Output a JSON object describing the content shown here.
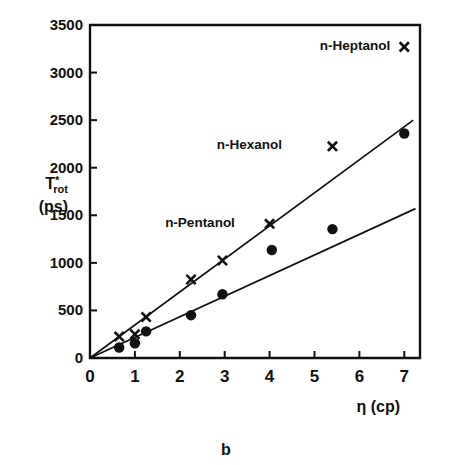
{
  "chart_data": {
    "type": "scatter",
    "title": "",
    "caption": "b",
    "xlabel": "η (cp)",
    "ylabel_main": "T",
    "ylabel_superscript": "*",
    "ylabel_subscript": "rot",
    "ylabel_units": "(ps)",
    "xlim": [
      0,
      7.35
    ],
    "ylim": [
      0,
      3500
    ],
    "grid": false,
    "legend_position": "inline-annotations",
    "xticks": [
      0,
      1,
      2,
      3,
      4,
      5,
      6,
      7
    ],
    "xtick_labels": [
      "0",
      "1",
      "2",
      "3",
      "4",
      "5",
      "6",
      "7"
    ],
    "yticks": [
      0,
      500,
      1000,
      1500,
      2000,
      2500,
      3000,
      3500
    ],
    "ytick_labels": [
      "0",
      "500",
      "1000",
      "1500",
      "2000",
      "2500",
      "3000",
      "3500"
    ],
    "annotations": [
      {
        "text": "n-Heptanol",
        "x": 5.9,
        "y": 3280
      },
      {
        "text": "n-Hexanol",
        "x": 3.55,
        "y": 2240
      },
      {
        "text": "n-Pentanol",
        "x": 2.45,
        "y": 1420
      }
    ],
    "series": [
      {
        "name": "upper-series-x-markers",
        "marker": "x",
        "x": [
          0.65,
          1.0,
          1.25,
          2.25,
          2.95,
          4.0,
          5.4,
          7.0
        ],
        "values": [
          225,
          250,
          430,
          825,
          1025,
          1410,
          2225,
          3270
        ]
      },
      {
        "name": "lower-series-circle-markers",
        "marker": "circle",
        "x": [
          0.65,
          1.0,
          1.25,
          2.25,
          2.95,
          4.05,
          5.4,
          7.0
        ],
        "values": [
          110,
          155,
          280,
          450,
          670,
          1135,
          1355,
          2360
        ]
      }
    ],
    "fit_lines": [
      {
        "name": "upper-fit-line",
        "x": [
          0.0,
          7.2
        ],
        "y": [
          0,
          2500
        ]
      },
      {
        "name": "lower-fit-line",
        "x": [
          0.0,
          7.25
        ],
        "y": [
          0,
          1570
        ]
      }
    ]
  }
}
